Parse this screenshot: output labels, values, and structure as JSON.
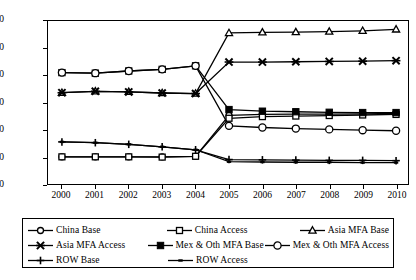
{
  "chart_data": {
    "type": "line",
    "title": "",
    "xlabel": "",
    "ylabel": "hSare of US Apparel Imports",
    "x": [
      2000,
      2001,
      2002,
      2003,
      2004,
      2005,
      2006,
      2007,
      2008,
      2009,
      2010
    ],
    "xlim": [
      2000,
      2010
    ],
    "ylim": [
      0,
      60
    ],
    "yticks": [
      0,
      10,
      20,
      30,
      40,
      50,
      60
    ],
    "xticks": [
      "2000",
      "2001",
      "2002",
      "2003",
      "2004",
      "2005",
      "2006",
      "2007",
      "2008",
      "2009",
      "2010"
    ],
    "grid": false,
    "legend_position": "bottom",
    "series": [
      {
        "name": "China Base",
        "marker": "open-circle",
        "values": [
          10.0,
          10.0,
          10.0,
          10.0,
          10.2,
          25.3,
          25.6,
          25.7,
          25.7,
          25.8,
          26.0
        ]
      },
      {
        "name": "China Access",
        "marker": "open-square",
        "values": [
          10.0,
          10.0,
          10.0,
          9.9,
          10.2,
          24.2,
          24.8,
          25.0,
          25.2,
          25.4,
          25.6
        ]
      },
      {
        "name": "Asia MFA Base",
        "marker": "open-triangle",
        "values": [
          33.6,
          34.1,
          33.9,
          33.5,
          33.3,
          55.6,
          55.8,
          55.9,
          56.1,
          56.4,
          56.9
        ]
      },
      {
        "name": "Asia MFA Access",
        "marker": "cross-x",
        "values": [
          33.6,
          34.1,
          33.9,
          33.5,
          33.3,
          44.9,
          44.9,
          45.0,
          45.1,
          45.2,
          45.4
        ]
      },
      {
        "name": "Mex & Oth MFA Base",
        "marker": "filled-square",
        "values": [
          41.0,
          40.8,
          41.6,
          42.2,
          43.5,
          27.4,
          26.8,
          26.6,
          26.4,
          26.3,
          26.3
        ]
      },
      {
        "name": "Mex & Oth MFA Access",
        "marker": "large-open-circle",
        "values": [
          41.0,
          40.8,
          41.6,
          42.2,
          43.5,
          21.4,
          20.8,
          20.4,
          20.1,
          19.8,
          19.6
        ]
      },
      {
        "name": "ROW Base",
        "marker": "plus",
        "values": [
          15.5,
          15.2,
          14.6,
          13.7,
          12.6,
          9.0,
          8.9,
          8.8,
          8.7,
          8.7,
          8.6
        ]
      },
      {
        "name": "ROW Access",
        "marker": "small-dash",
        "values": [
          15.5,
          15.2,
          14.6,
          13.7,
          12.6,
          8.2,
          8.1,
          8.0,
          8.0,
          7.9,
          7.9
        ]
      }
    ]
  },
  "legend": {
    "rows": [
      [
        "China Base",
        "China Access",
        "Asia MFA Base"
      ],
      [
        "Asia MFA Access",
        "Mex & Oth MFA Base",
        "Mex & Oth MFA Access"
      ],
      [
        "ROW Base",
        "ROW Access"
      ]
    ]
  }
}
